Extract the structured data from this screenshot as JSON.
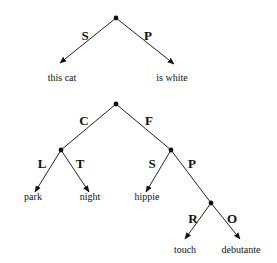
{
  "trees": [
    {
      "name": "sentence-tree",
      "root": {
        "x": 116,
        "y": 18
      },
      "edges": [
        {
          "label": "S",
          "to": "this cat",
          "from": [
            116,
            18
          ],
          "end": [
            60,
            63
          ],
          "label_pos": [
            85,
            40
          ],
          "text_pos": [
            62,
            81
          ]
        },
        {
          "label": "P",
          "to": "is white",
          "from": [
            116,
            18
          ],
          "end": [
            174,
            64
          ],
          "label_pos": [
            148,
            40
          ],
          "text_pos": [
            172,
            81
          ]
        }
      ]
    },
    {
      "name": "concept-tree",
      "root": {
        "x": 116,
        "y": 104
      },
      "edges": [
        {
          "label": "C",
          "from": [
            116,
            104
          ],
          "end": [
            61,
            150
          ],
          "label_pos": [
            84,
            125
          ]
        },
        {
          "label": "F",
          "from": [
            116,
            104
          ],
          "end": [
            171,
            150
          ],
          "label_pos": [
            149,
            125
          ]
        },
        {
          "label": "L",
          "to": "park",
          "from": [
            61,
            150
          ],
          "end": [
            35,
            192
          ],
          "label_pos": [
            42,
            168
          ],
          "text_pos": [
            33,
            200
          ]
        },
        {
          "label": "T",
          "to": "night",
          "from": [
            61,
            150
          ],
          "end": [
            89,
            192
          ],
          "label_pos": [
            80,
            168
          ],
          "text_pos": [
            90,
            200
          ]
        },
        {
          "label": "S",
          "to": "hippie",
          "from": [
            171,
            150
          ],
          "end": [
            146,
            192
          ],
          "label_pos": [
            152,
            168
          ],
          "text_pos": [
            147,
            200
          ]
        },
        {
          "label": "P",
          "from": [
            171,
            150
          ],
          "end": [
            211,
            203
          ],
          "label_pos": [
            192,
            168
          ]
        },
        {
          "label": "R",
          "to": "touch",
          "from": [
            211,
            203
          ],
          "end": [
            185,
            239
          ],
          "label_pos": [
            193,
            223
          ],
          "text_pos": [
            185,
            253
          ]
        },
        {
          "label": "O",
          "to": "debutante",
          "from": [
            211,
            203
          ],
          "end": [
            240,
            239
          ],
          "label_pos": [
            232,
            223
          ],
          "text_pos": [
            241,
            253
          ]
        }
      ],
      "internal_nodes": [
        [
          61,
          150
        ],
        [
          171,
          150
        ],
        [
          211,
          203
        ]
      ]
    }
  ],
  "labels": {
    "t1_S": "S",
    "t1_P": "P",
    "t1_leaf_left": "this cat",
    "t1_leaf_right": "is white",
    "t2_C": "C",
    "t2_F": "F",
    "t2_L": "L",
    "t2_T": "T",
    "t2_S": "S",
    "t2_P": "P",
    "t2_R": "R",
    "t2_O": "O",
    "t2_park": "park",
    "t2_night": "night",
    "t2_hippie": "hippie",
    "t2_touch": "touch",
    "t2_debutante": "debutante"
  }
}
